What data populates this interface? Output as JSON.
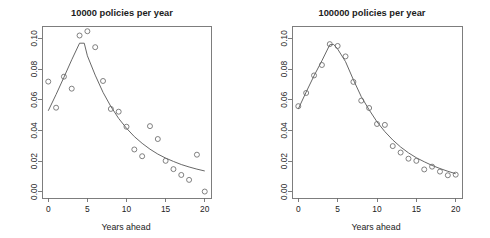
{
  "figure": {
    "background": "#ffffff",
    "width": 490,
    "height": 238,
    "panel_count": 2
  },
  "axis_label": "Years ahead",
  "chart_data": [
    {
      "type": "scatter",
      "panel": "left",
      "title": "10000 policies per year",
      "xlabel": "Years ahead",
      "ylabel": "",
      "xlim": [
        -0.8,
        20.8
      ],
      "ylim": [
        -0.004,
        0.108
      ],
      "xticks": [
        0,
        5,
        10,
        15,
        20
      ],
      "xticklabels": [
        "0",
        "5",
        "10",
        "15",
        "20"
      ],
      "yticks": [
        0.0,
        0.02,
        0.04,
        0.06,
        0.08,
        0.1
      ],
      "yticklabels": [
        "0.00",
        "0.02",
        "0.04",
        "0.06",
        "0.08",
        "0.10"
      ],
      "grid": false,
      "legend": false,
      "marker": "open-circle",
      "series": [
        {
          "name": "observed",
          "style": "points",
          "x": [
            0,
            1,
            2,
            3,
            4,
            5,
            6,
            7,
            8,
            9,
            10,
            11,
            12,
            13,
            14,
            15,
            16,
            17,
            18,
            19,
            20
          ],
          "y": [
            0.0718,
            0.0548,
            0.075,
            0.0672,
            0.1018,
            0.1046,
            0.0942,
            0.0722,
            0.054,
            0.0522,
            0.0424,
            0.0276,
            0.0232,
            0.0428,
            0.0344,
            0.0202,
            0.0148,
            0.011,
            0.0078,
            0.0242,
            0.0002
          ]
        },
        {
          "name": "fitted curve",
          "style": "line",
          "x": [
            0,
            1,
            2,
            3,
            4,
            4.6,
            5,
            6,
            7,
            8,
            9,
            10,
            11,
            12,
            13,
            14,
            15,
            16,
            17,
            18,
            19,
            20
          ],
          "y": [
            0.0528,
            0.0634,
            0.0746,
            0.086,
            0.0968,
            0.0968,
            0.0886,
            0.076,
            0.0648,
            0.0556,
            0.0478,
            0.0414,
            0.036,
            0.0316,
            0.0278,
            0.0246,
            0.022,
            0.0198,
            0.0178,
            0.0162,
            0.0148,
            0.0136
          ]
        }
      ]
    },
    {
      "type": "scatter",
      "panel": "right",
      "title": "100000 policies per year",
      "xlabel": "Years ahead",
      "ylabel": "",
      "xlim": [
        -0.8,
        20.8
      ],
      "ylim": [
        -0.004,
        0.108
      ],
      "xticks": [
        0,
        5,
        10,
        15,
        20
      ],
      "xticklabels": [
        "0",
        "5",
        "10",
        "15",
        "20"
      ],
      "yticks": [
        0.0,
        0.02,
        0.04,
        0.06,
        0.08,
        0.1
      ],
      "yticklabels": [
        "0.00",
        "0.02",
        "0.04",
        "0.06",
        "0.08",
        "0.10"
      ],
      "grid": false,
      "legend": false,
      "marker": "open-circle",
      "series": [
        {
          "name": "observed",
          "style": "points",
          "x": [
            0,
            1,
            2,
            3,
            4,
            5,
            6,
            7,
            8,
            9,
            10,
            11,
            12,
            13,
            14,
            15,
            16,
            17,
            18,
            19,
            20
          ],
          "y": [
            0.0558,
            0.0644,
            0.0758,
            0.0826,
            0.0962,
            0.095,
            0.0882,
            0.0716,
            0.0594,
            0.0546,
            0.0442,
            0.0436,
            0.0298,
            0.0256,
            0.0216,
            0.0202,
            0.0146,
            0.0164,
            0.0132,
            0.0108,
            0.0112
          ]
        },
        {
          "name": "fitted curve",
          "style": "line",
          "x": [
            0,
            1,
            2,
            3,
            4,
            4.5,
            5,
            6,
            7,
            8,
            9,
            10,
            11,
            12,
            13,
            14,
            15,
            16,
            17,
            18,
            19,
            20
          ],
          "y": [
            0.054,
            0.065,
            0.0756,
            0.0854,
            0.0958,
            0.096,
            0.093,
            0.0848,
            0.073,
            0.062,
            0.0534,
            0.0456,
            0.0392,
            0.0338,
            0.0292,
            0.0254,
            0.0222,
            0.0196,
            0.0172,
            0.0152,
            0.0134,
            0.0118
          ]
        }
      ]
    }
  ]
}
